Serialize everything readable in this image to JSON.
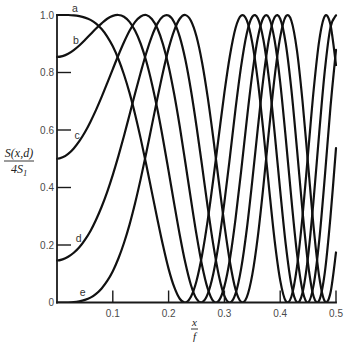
{
  "colors": {
    "background": "#ffffff",
    "curve": "#111111",
    "axis": "#1a1a1a",
    "tick_text": "#4a4a4a"
  },
  "chart_data": {
    "type": "line",
    "title": "",
    "xlabel": {
      "numerator": "x",
      "denominator": "f"
    },
    "ylabel": {
      "numerator": "S(x,d)",
      "denominator": "4S",
      "denominator_subscript": "1"
    },
    "xlim": [
      0,
      0.5
    ],
    "ylim": [
      0,
      1.0
    ],
    "grid": false,
    "legend": "none (curves labelled inline near x = 0)",
    "x_ticks": [
      {
        "value": 0.1,
        "label": "0.1"
      },
      {
        "value": 0.2,
        "label": "0.2"
      },
      {
        "value": 0.3,
        "label": "0.3"
      },
      {
        "value": 0.4,
        "label": "0.4"
      },
      {
        "value": 0.5,
        "label": "0.5"
      }
    ],
    "y_ticks": [
      {
        "value": 0.0,
        "label": "0"
      },
      {
        "value": 0.2,
        "label": "0.2"
      },
      {
        "value": 0.4,
        "label": "0.4"
      },
      {
        "value": 0.6,
        "label": "0.6"
      },
      {
        "value": 0.8,
        "label": "0.8"
      },
      {
        "value": 1.0,
        "label": "1.0"
      }
    ],
    "x": [
      0,
      0.01,
      0.02,
      0.03,
      0.04,
      0.05,
      0.06,
      0.07,
      0.08,
      0.09,
      0.1,
      0.11,
      0.12,
      0.13,
      0.14,
      0.15,
      0.16,
      0.17,
      0.18,
      0.19,
      0.2,
      0.21,
      0.22,
      0.23,
      0.24,
      0.25,
      0.26,
      0.27,
      0.28,
      0.29,
      0.3,
      0.31,
      0.32,
      0.33,
      0.34,
      0.35,
      0.36,
      0.37,
      0.38,
      0.39,
      0.4,
      0.41,
      0.42,
      0.43,
      0.44,
      0.45,
      0.46,
      0.47,
      0.48,
      0.49,
      0.5
    ],
    "series": [
      {
        "name": "a",
        "label_pos": [
          0.032,
          1.024
        ],
        "values": [
          1.0,
          1.0,
          1.0,
          0.999,
          0.996,
          0.991,
          0.983,
          0.97,
          0.951,
          0.925,
          0.891,
          0.847,
          0.793,
          0.729,
          0.654,
          0.57,
          0.479,
          0.384,
          0.289,
          0.198,
          0.117,
          0.054,
          0.013,
          0.0,
          0.02,
          0.075,
          0.165,
          0.285,
          0.427,
          0.58,
          0.73,
          0.86,
          0.955,
          0.998,
          0.982,
          0.903,
          0.769,
          0.593,
          0.399,
          0.216,
          0.077,
          0.005,
          0.02,
          0.123,
          0.3,
          0.52,
          0.74,
          0.912,
          0.996,
          0.967,
          0.826
        ]
      },
      {
        "name": "b",
        "label_pos": [
          0.034,
          0.911
        ],
        "values": [
          0.854,
          0.857,
          0.865,
          0.878,
          0.894,
          0.913,
          0.933,
          0.953,
          0.971,
          0.987,
          0.997,
          1.0,
          0.994,
          0.976,
          0.945,
          0.9,
          0.839,
          0.762,
          0.671,
          0.568,
          0.457,
          0.344,
          0.235,
          0.138,
          0.061,
          0.013,
          0.001,
          0.029,
          0.099,
          0.208,
          0.349,
          0.508,
          0.674,
          0.822,
          0.935,
          0.994,
          0.988,
          0.913,
          0.775,
          0.591,
          0.389,
          0.201,
          0.062,
          0.001,
          0.034,
          0.161,
          0.36,
          0.592,
          0.807,
          0.956,
          0.999
        ]
      },
      {
        "name": "c",
        "label_pos": [
          0.036,
          0.58
        ],
        "values": [
          0.5,
          0.505,
          0.517,
          0.536,
          0.561,
          0.592,
          0.629,
          0.67,
          0.715,
          0.763,
          0.812,
          0.86,
          0.905,
          0.945,
          0.976,
          0.995,
          1.0,
          0.986,
          0.953,
          0.898,
          0.822,
          0.725,
          0.612,
          0.487,
          0.359,
          0.236,
          0.129,
          0.049,
          0.005,
          0.006,
          0.056,
          0.153,
          0.292,
          0.457,
          0.633,
          0.795,
          0.922,
          0.991,
          0.99,
          0.912,
          0.766,
          0.571,
          0.361,
          0.172,
          0.042,
          0.0,
          0.062,
          0.217,
          0.438,
          0.678,
          0.879
        ]
      },
      {
        "name": "d",
        "label_pos": [
          0.039,
          0.221
        ],
        "values": [
          0.146,
          0.15,
          0.159,
          0.173,
          0.192,
          0.218,
          0.249,
          0.288,
          0.333,
          0.385,
          0.444,
          0.509,
          0.579,
          0.653,
          0.728,
          0.8,
          0.868,
          0.926,
          0.97,
          0.995,
          0.998,
          0.975,
          0.924,
          0.845,
          0.739,
          0.613,
          0.475,
          0.333,
          0.202,
          0.094,
          0.023,
          0.0,
          0.031,
          0.118,
          0.253,
          0.424,
          0.608,
          0.782,
          0.918,
          0.992,
          0.987,
          0.9,
          0.741,
          0.535,
          0.318,
          0.133,
          0.02,
          0.008,
          0.105,
          0.296,
          0.537
        ]
      },
      {
        "name": "e",
        "label_pos": [
          0.046,
          0.034
        ],
        "values": [
          0.0,
          0.0,
          0.0,
          0.001,
          0.004,
          0.009,
          0.017,
          0.03,
          0.049,
          0.075,
          0.109,
          0.153,
          0.207,
          0.271,
          0.346,
          0.43,
          0.521,
          0.616,
          0.711,
          0.802,
          0.883,
          0.946,
          0.987,
          1.0,
          0.98,
          0.925,
          0.835,
          0.715,
          0.573,
          0.42,
          0.27,
          0.14,
          0.045,
          0.002,
          0.018,
          0.097,
          0.231,
          0.407,
          0.601,
          0.784,
          0.923,
          0.995,
          0.98,
          0.877,
          0.7,
          0.48,
          0.26,
          0.088,
          0.004,
          0.033,
          0.174
        ]
      }
    ]
  }
}
